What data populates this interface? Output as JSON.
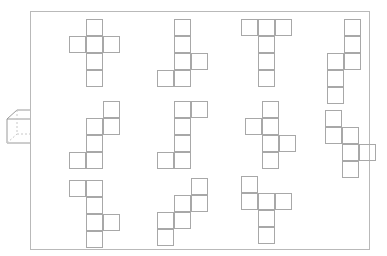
{
  "figure": {
    "width": 387,
    "height": 256,
    "background_color": "#ffffff",
    "panel": {
      "x": 30,
      "y": 11,
      "width": 340,
      "height": 239,
      "border_color": "#b9b9b9",
      "border_width": 1,
      "fill_color": "#ffffff"
    },
    "cube_icon": {
      "label": "cube-3d",
      "x": 5,
      "y": 107,
      "width": 38,
      "height": 42,
      "stroke_color": "#9a9a9a",
      "hidden_edge_color": "#c8c8c8",
      "stroke_width": 1,
      "projection": "isometric-wireframe",
      "front_face": {
        "x": 2,
        "y": 12,
        "width": 24,
        "height": 24
      },
      "depth_offset": {
        "dx": 10,
        "dy": -9
      }
    },
    "net_style": {
      "cell_size": 17,
      "stroke_color": "#a8a8a8",
      "stroke_width": 1,
      "fill_color": "transparent"
    },
    "nets": [
      {
        "id": "net-1",
        "name": "plus-cross-net",
        "row": 1,
        "column": 1,
        "x": 69,
        "y": 19,
        "cols": 3,
        "rows": 4,
        "cell_count": 6,
        "shape_label": "cross",
        "cells": [
          {
            "col": 2,
            "row": 1
          },
          {
            "col": 1,
            "row": 2
          },
          {
            "col": 2,
            "row": 2
          },
          {
            "col": 3,
            "row": 2
          },
          {
            "col": 2,
            "row": 3
          },
          {
            "col": 2,
            "row": 4
          }
        ]
      },
      {
        "id": "net-2",
        "name": "column-right-left-net",
        "row": 1,
        "column": 2,
        "x": 157,
        "y": 19,
        "cols": 3,
        "rows": 4,
        "cell_count": 6,
        "shape_label": "zigzag-column",
        "cells": [
          {
            "col": 2,
            "row": 1
          },
          {
            "col": 2,
            "row": 2
          },
          {
            "col": 2,
            "row": 3
          },
          {
            "col": 3,
            "row": 3
          },
          {
            "col": 1,
            "row": 4
          },
          {
            "col": 2,
            "row": 4
          }
        ]
      },
      {
        "id": "net-3",
        "name": "tee-net",
        "row": 1,
        "column": 3,
        "x": 241,
        "y": 19,
        "cols": 3,
        "rows": 4,
        "cell_count": 6,
        "shape_label": "T-shape",
        "cells": [
          {
            "col": 1,
            "row": 1
          },
          {
            "col": 2,
            "row": 1
          },
          {
            "col": 3,
            "row": 1
          },
          {
            "col": 2,
            "row": 2
          },
          {
            "col": 2,
            "row": 3
          },
          {
            "col": 2,
            "row": 4
          }
        ]
      },
      {
        "id": "net-4",
        "name": "offset-double-column-net",
        "row": 1,
        "column": 4,
        "x": 327,
        "y": 19,
        "cols": 2,
        "rows": 5,
        "cell_count": 6,
        "shape_label": "S-stair",
        "cells": [
          {
            "col": 2,
            "row": 1
          },
          {
            "col": 2,
            "row": 2
          },
          {
            "col": 1,
            "row": 3
          },
          {
            "col": 2,
            "row": 3
          },
          {
            "col": 1,
            "row": 4
          },
          {
            "col": 1,
            "row": 5
          }
        ]
      },
      {
        "id": "net-5",
        "name": "staircase-left-net",
        "row": 2,
        "column": 1,
        "x": 69,
        "y": 101,
        "cols": 3,
        "rows": 4,
        "cell_count": 6,
        "shape_label": "staircase",
        "cells": [
          {
            "col": 3,
            "row": 1
          },
          {
            "col": 2,
            "row": 2
          },
          {
            "col": 3,
            "row": 2
          },
          {
            "col": 2,
            "row": 3
          },
          {
            "col": 1,
            "row": 4
          },
          {
            "col": 2,
            "row": 4
          }
        ]
      },
      {
        "id": "net-6",
        "name": "column-top-right-bottom-left-net",
        "row": 2,
        "column": 2,
        "x": 157,
        "y": 101,
        "cols": 3,
        "rows": 4,
        "cell_count": 6,
        "shape_label": "Z-column",
        "cells": [
          {
            "col": 2,
            "row": 1
          },
          {
            "col": 3,
            "row": 1
          },
          {
            "col": 2,
            "row": 2
          },
          {
            "col": 2,
            "row": 3
          },
          {
            "col": 1,
            "row": 4
          },
          {
            "col": 2,
            "row": 4
          }
        ]
      },
      {
        "id": "net-7",
        "name": "column-with-opposite-arms-net",
        "row": 2,
        "column": 3,
        "x": 245,
        "y": 101,
        "cols": 3,
        "rows": 4,
        "cell_count": 6,
        "shape_label": "offset-cross",
        "cells": [
          {
            "col": 2,
            "row": 1
          },
          {
            "col": 1,
            "row": 2
          },
          {
            "col": 2,
            "row": 2
          },
          {
            "col": 2,
            "row": 3
          },
          {
            "col": 3,
            "row": 3
          },
          {
            "col": 2,
            "row": 4
          }
        ]
      },
      {
        "id": "net-8",
        "name": "stepped-zigzag-net",
        "row": 2,
        "column": 4,
        "x": 325,
        "y": 110,
        "cols": 3,
        "rows": 4,
        "cell_count": 6,
        "shape_label": "stepped-zigzag",
        "cells": [
          {
            "col": 1,
            "row": 1
          },
          {
            "col": 1,
            "row": 2
          },
          {
            "col": 2,
            "row": 2
          },
          {
            "col": 2,
            "row": 3
          },
          {
            "col": 3,
            "row": 3
          },
          {
            "col": 2,
            "row": 4
          }
        ]
      },
      {
        "id": "net-9",
        "name": "top-pair-column-right-arm-net",
        "row": 3,
        "column": 1,
        "x": 69,
        "y": 180,
        "cols": 3,
        "rows": 4,
        "cell_count": 6,
        "shape_label": "hook",
        "cells": [
          {
            "col": 1,
            "row": 1
          },
          {
            "col": 2,
            "row": 1
          },
          {
            "col": 2,
            "row": 2
          },
          {
            "col": 2,
            "row": 3
          },
          {
            "col": 3,
            "row": 3
          },
          {
            "col": 2,
            "row": 4
          }
        ]
      },
      {
        "id": "net-10",
        "name": "staircase-descending-net",
        "row": 3,
        "column": 2,
        "x": 157,
        "y": 178,
        "cols": 3,
        "rows": 4,
        "cell_count": 6,
        "shape_label": "staircase",
        "cells": [
          {
            "col": 3,
            "row": 1
          },
          {
            "col": 2,
            "row": 2
          },
          {
            "col": 3,
            "row": 2
          },
          {
            "col": 1,
            "row": 3
          },
          {
            "col": 2,
            "row": 3
          },
          {
            "col": 1,
            "row": 4
          }
        ]
      },
      {
        "id": "net-11",
        "name": "corner-row-column-net",
        "row": 3,
        "column": 3,
        "x": 241,
        "y": 176,
        "cols": 3,
        "rows": 4,
        "cell_count": 6,
        "shape_label": "corner-tee",
        "cells": [
          {
            "col": 1,
            "row": 1
          },
          {
            "col": 1,
            "row": 2
          },
          {
            "col": 2,
            "row": 2
          },
          {
            "col": 3,
            "row": 2
          },
          {
            "col": 2,
            "row": 3
          },
          {
            "col": 2,
            "row": 4
          }
        ]
      }
    ]
  }
}
